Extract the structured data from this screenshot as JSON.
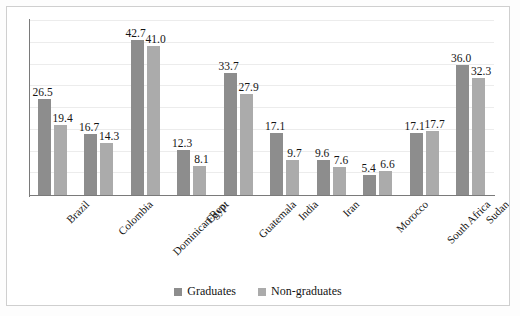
{
  "chart_data": {
    "type": "bar",
    "title": "",
    "subtitle": "",
    "xlabel": "",
    "ylabel": "",
    "ylim": [
      0,
      48
    ],
    "grid": true,
    "grid_axis": "y",
    "legend_position": "bottom-center",
    "orientation": "vertical",
    "categories": [
      "Brazil",
      "Colombia",
      "Dominican Rep.",
      "Egypt",
      "Guatemala",
      "India",
      "Iran",
      "Morocco",
      "South Africa",
      "Sudan"
    ],
    "series": [
      {
        "name": "Graduates",
        "color": "#8d8d8d",
        "values": [
          26.5,
          16.7,
          42.7,
          12.3,
          33.7,
          17.1,
          9.6,
          5.4,
          17.1,
          36.0
        ],
        "labels": [
          "26.5",
          "16.7",
          "42.7",
          "12.3",
          "33.7",
          "17.1",
          "9.6",
          "5.4",
          "17.1",
          "36.0"
        ]
      },
      {
        "name": "Non-graduates",
        "color": "#ababab",
        "values": [
          19.4,
          14.3,
          41.0,
          8.1,
          27.9,
          9.7,
          7.6,
          6.6,
          17.7,
          32.3
        ],
        "labels": [
          "19.4",
          "14.3",
          "41.0",
          "8.1",
          "27.9",
          "9.7",
          "7.6",
          "6.6",
          "17.7",
          "32.3"
        ]
      }
    ],
    "data_labels_shown": true,
    "axis_tick_labels": []
  },
  "legend": {
    "items": [
      {
        "label": "Graduates",
        "color": "#8d8d8d"
      },
      {
        "label": "Non-graduates",
        "color": "#ababab"
      }
    ]
  }
}
